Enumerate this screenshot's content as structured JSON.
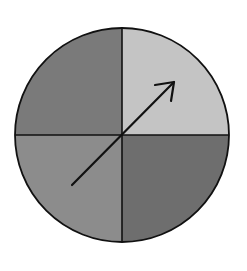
{
  "diagram": {
    "type": "spinner",
    "sections": [
      {
        "name": "top-left",
        "color": "#7a7a7a"
      },
      {
        "name": "top-right",
        "color": "#c4c4c4"
      },
      {
        "name": "bottom-right",
        "color": "#6e6e6e"
      },
      {
        "name": "bottom-left",
        "color": "#8c8c8c"
      }
    ],
    "outline_color": "#111111",
    "arrow": {
      "from": [
        72,
        185
      ],
      "to": [
        175,
        81
      ],
      "color": "#111111"
    }
  }
}
